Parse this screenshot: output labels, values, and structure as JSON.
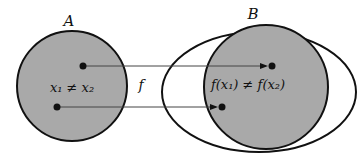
{
  "diagram": {
    "set_a": {
      "label": "A",
      "fill": "#a9a9a9",
      "text": "x₁ ≠ x₂"
    },
    "set_b": {
      "label": "B",
      "fill": "#ffffff",
      "image_fill": "#a9a9a9",
      "text": "f(x₁) ≠ f(x₂)"
    },
    "map_label": "f",
    "stroke": "#111111"
  }
}
